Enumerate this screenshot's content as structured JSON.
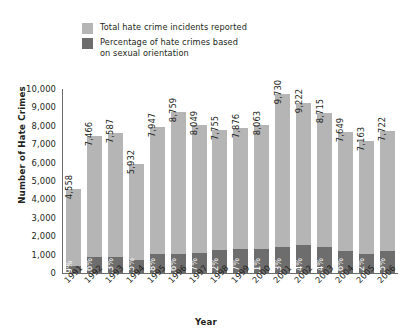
{
  "chart_data": {
    "type": "bar",
    "title": "",
    "subtitle": "",
    "xlabel": "Year",
    "ylabel": "Number of Hate Crimes",
    "ylim": [
      0,
      10000
    ],
    "ytick_labels": [
      "10,000",
      "9,000",
      "8,000",
      "7,000",
      "6,000",
      "5,000",
      "4,000",
      "3,000",
      "2,000",
      "1,000",
      "0"
    ],
    "ytick_values": [
      10000,
      9000,
      8000,
      7000,
      6000,
      5000,
      4000,
      3000,
      2000,
      1000,
      0
    ],
    "grid": false,
    "legend_position": "top-left",
    "categories": [
      "1991",
      "1992",
      "1993",
      "1994",
      "1995",
      "1996",
      "1997",
      "1998",
      "1999",
      "2000",
      "2001",
      "2002",
      "2003",
      "2004",
      "2005",
      "2006"
    ],
    "series": [
      {
        "name": "Total hate crime incidents reported",
        "color": "#b5b5b5",
        "values": [
          4558,
          7466,
          7587,
          5932,
          7947,
          8759,
          8049,
          7755,
          7876,
          8063,
          9730,
          9222,
          8715,
          7649,
          7163,
          7722
        ],
        "value_labels": [
          "4,558",
          "7,466",
          "7,587",
          "5,932",
          "7,947",
          "8,759",
          "8,049",
          "7,755",
          "7,876",
          "8,063",
          "9,730",
          "9,222",
          "8,715",
          "7,649",
          "7,163",
          "7,722"
        ]
      },
      {
        "name": "Percentage of hate crimes based on sexual orientation",
        "color": "#6d6d6d",
        "values": [
          8.9,
          11.6,
          11.3,
          11.5,
          12.8,
          11.6,
          13.7,
          16.2,
          16.7,
          16.1,
          14.3,
          16.4,
          16.4,
          15.6,
          14.2,
          15.5
        ],
        "value_labels": [
          "8.9%",
          "11.6%",
          "11.3%",
          "11.5%",
          "12.8%",
          "11.6%",
          "13.7%",
          "16.2%",
          "16.7%",
          "16.1%",
          "14.3%",
          "16.4%",
          "16.4%",
          "15.6%",
          "14.2%",
          "15.5%"
        ]
      }
    ]
  },
  "legend": {
    "items": [
      {
        "label": "Total hate crime incidents reported",
        "swatch_class": "total",
        "color": "#b5b5b5"
      },
      {
        "label": "Percentage of hate crimes based\non sexual orientation",
        "swatch_class": "pct",
        "color": "#6d6d6d"
      }
    ]
  },
  "colors": {
    "total_bar": "#b5b5b5",
    "pct_bar": "#6d6d6d",
    "axis": "#6b6b6b",
    "text": "#231f20",
    "background": "#ffffff"
  }
}
